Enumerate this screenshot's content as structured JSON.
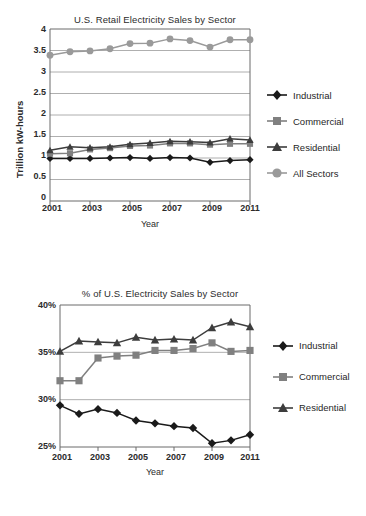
{
  "figure": {
    "charts": [
      {
        "id": "retail-electricity-sales",
        "title": "U.S. Retail Electricity Sales by Sector",
        "xlabel": "Year",
        "ylabel": "Trillion  kW-hours",
        "yticks": [
          "4",
          "3.5",
          "3",
          "2.5",
          "2",
          "1.5",
          "1",
          "0.5",
          "0"
        ],
        "xticks": [
          "2001",
          "2003",
          "2005",
          "2007",
          "2009",
          "2011"
        ],
        "legend": [
          {
            "label": "Industrial",
            "marker": "diamond-marker-icon",
            "color": "#1a1a1a"
          },
          {
            "label": "Commercial",
            "marker": "square-marker-icon",
            "color": "#808080"
          },
          {
            "label": "Residential",
            "marker": "triangle-marker-icon",
            "color": "#3d3d3d"
          },
          {
            "label": "All Sectors",
            "marker": "circle-marker-icon",
            "color": "#9a9a9a"
          }
        ]
      },
      {
        "id": "percent-electricity-sales",
        "title": "% of U.S. Electricity Sales by Sector",
        "xlabel": "Year",
        "ylabel": "",
        "yticks": [
          "40%",
          "35%",
          "30%",
          "25%"
        ],
        "xticks": [
          "2001",
          "2003",
          "2005",
          "2007",
          "2009",
          "2011"
        ],
        "legend": [
          {
            "label": "Industrial",
            "marker": "diamond-marker-icon",
            "color": "#1a1a1a"
          },
          {
            "label": "Commercial",
            "marker": "square-marker-icon",
            "color": "#808080"
          },
          {
            "label": "Residential",
            "marker": "triangle-marker-icon",
            "color": "#3d3d3d"
          }
        ]
      }
    ]
  },
  "chart_data": [
    {
      "type": "line",
      "title": "U.S. Retail Electricity Sales by Sector",
      "xlabel": "Year",
      "ylabel": "Trillion  kW-hours",
      "x": [
        2001,
        2002,
        2003,
        2004,
        2005,
        2006,
        2007,
        2008,
        2009,
        2010,
        2011
      ],
      "xlim": [
        2001,
        2011
      ],
      "ylim": [
        0,
        4
      ],
      "ytick_values": [
        0,
        0.5,
        1,
        1.5,
        2,
        2.5,
        3,
        3.5,
        4
      ],
      "xtick_values": [
        2001,
        2003,
        2005,
        2007,
        2009,
        2011
      ],
      "grid": "horizontal",
      "legend_position": "right",
      "series": [
        {
          "name": "Industrial",
          "marker": "diamond",
          "color": "#1a1a1a",
          "values": [
            0.99,
            0.99,
            0.99,
            1.0,
            1.01,
            0.99,
            1.01,
            1.0,
            0.9,
            0.94,
            0.96
          ]
        },
        {
          "name": "Commercial",
          "marker": "square",
          "color": "#808080",
          "values": [
            1.1,
            1.11,
            1.2,
            1.23,
            1.28,
            1.29,
            1.34,
            1.34,
            1.31,
            1.33,
            1.33
          ]
        },
        {
          "name": "Residential",
          "marker": "triangle",
          "color": "#3d3d3d",
          "values": [
            1.18,
            1.26,
            1.24,
            1.26,
            1.32,
            1.35,
            1.39,
            1.38,
            1.36,
            1.45,
            1.42
          ]
        },
        {
          "name": "All Sectors",
          "marker": "circle",
          "color": "#9a9a9a",
          "values": [
            3.39,
            3.47,
            3.49,
            3.54,
            3.66,
            3.67,
            3.77,
            3.73,
            3.58,
            3.75,
            3.75
          ]
        }
      ]
    },
    {
      "type": "line",
      "title": "% of U.S. Electricity Sales by Sector",
      "xlabel": "Year",
      "ylabel": "",
      "x": [
        2001,
        2002,
        2003,
        2004,
        2005,
        2006,
        2007,
        2008,
        2009,
        2010,
        2011
      ],
      "xlim": [
        2001,
        2011
      ],
      "ylim": [
        25,
        40
      ],
      "ytick_values": [
        25,
        30,
        35,
        40
      ],
      "xtick_values": [
        2001,
        2003,
        2005,
        2007,
        2009,
        2011
      ],
      "grid": "horizontal",
      "legend_position": "right",
      "series": [
        {
          "name": "Industrial",
          "marker": "diamond",
          "color": "#1a1a1a",
          "values": [
            29.4,
            28.5,
            29.0,
            28.6,
            27.8,
            27.5,
            27.2,
            27.0,
            25.4,
            25.7,
            26.3
          ]
        },
        {
          "name": "Commercial",
          "marker": "square",
          "color": "#808080",
          "values": [
            32.0,
            32.0,
            34.4,
            34.6,
            34.7,
            35.2,
            35.2,
            35.4,
            36.0,
            35.1,
            35.2
          ]
        },
        {
          "name": "Residential",
          "marker": "triangle",
          "color": "#3d3d3d",
          "values": [
            35.1,
            36.2,
            36.1,
            36.0,
            36.6,
            36.3,
            36.4,
            36.3,
            37.6,
            38.2,
            37.7
          ]
        }
      ]
    }
  ]
}
